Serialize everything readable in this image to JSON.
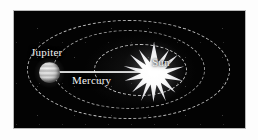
{
  "diagram": {
    "background_color": "#030303",
    "frame_border_color": "#b9b9b9",
    "page_background_color": "#fdfdfd"
  },
  "bodies": [
    {
      "id": "sun",
      "label": "Sun",
      "kind": "star",
      "render": "starburst",
      "color": "#ffffff",
      "position": {
        "x": 140,
        "y": 71
      }
    },
    {
      "id": "jupiter",
      "label": "Jupiter",
      "kind": "planet",
      "render": "banded-sphere",
      "color": "#e2e2e2",
      "position": {
        "x": 45,
        "y": 71
      }
    }
  ],
  "labels": {
    "jupiter": "Jupiter",
    "mercury": "Mercury",
    "sun": "Sun"
  },
  "orbits": [
    {
      "id": "orbit-outer",
      "belongs_to": "Jupiter",
      "style": "dashed",
      "stroke_color": "#e1e1e1"
    },
    {
      "id": "orbit-middle",
      "belongs_to": "",
      "style": "dashed",
      "stroke_color": "#d7d7d7"
    },
    {
      "id": "orbit-inner",
      "belongs_to": "Mercury",
      "style": "dashed",
      "stroke_color": "#e6e6e6"
    }
  ],
  "annotations": {
    "distance_line": {
      "label": "Mercury",
      "from": "Jupiter",
      "to": "Sun",
      "color": "#f2f2f2"
    }
  }
}
